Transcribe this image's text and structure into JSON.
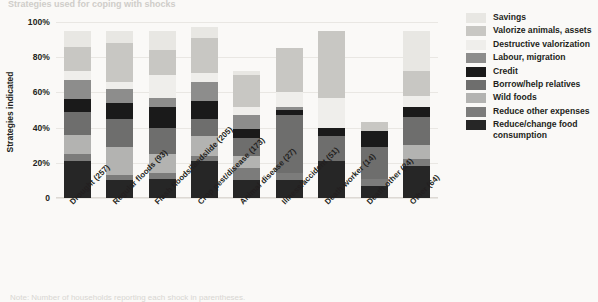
{
  "figure": {
    "title_sliver": "Strategies used for coping with shocks",
    "caption_sliver": "Note: Number of households reporting each shock in parentheses."
  },
  "axes": {
    "ylabel": "Strategies indicated",
    "yticks": [
      "0",
      "20%",
      "40%",
      "60%",
      "80%",
      "100%"
    ]
  },
  "legend": {
    "items": [
      {
        "label": "Savings",
        "color": "#e8e7e3"
      },
      {
        "label": "Valorize animals, assets",
        "color": "#c8c7c3"
      },
      {
        "label": "Destructive valorization",
        "color": "#efeeeb"
      },
      {
        "label": "Labour, migration",
        "color": "#8d8d8c"
      },
      {
        "label": "Credit",
        "color": "#1a1a1a"
      },
      {
        "label": "Borrow/help relatives",
        "color": "#6e6e6d"
      },
      {
        "label": "Wild foods",
        "color": "#b3b3b1"
      },
      {
        "label": "Reduce other expenses",
        "color": "#7c7c7b"
      },
      {
        "label": "Reduce/change food consumption",
        "color": "#262626"
      }
    ]
  },
  "chart_data": {
    "type": "bar",
    "subtype": "stacked-bar",
    "title": "Strategies used for coping with shocks",
    "xlabel": "",
    "ylabel": "Strategies indicated",
    "ylim": [
      0,
      100
    ],
    "yticks": [
      0,
      20,
      40,
      60,
      80,
      100
    ],
    "ytick_labels": [
      "0",
      "20%",
      "40%",
      "60%",
      "80%",
      "100%"
    ],
    "grid": true,
    "legend_position": "right",
    "stack_order_bottom_to_top": [
      "Reduce/change food consumption",
      "Reduce other expenses",
      "Wild foods",
      "Borrow/help relatives",
      "Credit",
      "Labour, migration",
      "Destructive valorization",
      "Valorize animals, assets",
      "Savings"
    ],
    "categories": [
      "Drought (257)",
      "Regular floods (93)",
      "Flash floods/landslide (205)",
      "Crop pest/disease (173)",
      "Animal disease (27)",
      "Illness/accident (51)",
      "Death worker (14)",
      "Death other (24)",
      "Other (64)"
    ],
    "series": [
      {
        "name": "Reduce/change food consumption",
        "color": "#262626",
        "values": [
          21,
          10,
          11,
          21,
          10,
          10,
          21,
          7,
          18
        ]
      },
      {
        "name": "Reduce other expenses",
        "color": "#7c7c7b",
        "values": [
          4,
          3,
          3,
          3,
          7,
          4,
          0,
          4,
          4
        ]
      },
      {
        "name": "Wild foods",
        "color": "#b3b3b1",
        "values": [
          11,
          16,
          11,
          11,
          7,
          0,
          0,
          0,
          8
        ]
      },
      {
        "name": "Borrow/help relatives",
        "color": "#6e6e6d",
        "values": [
          13,
          16,
          15,
          10,
          10,
          33,
          14,
          18,
          16
        ]
      },
      {
        "name": "Credit",
        "color": "#1a1a1a",
        "values": [
          7,
          9,
          12,
          10,
          5,
          3,
          5,
          9,
          6
        ]
      },
      {
        "name": "Labour, migration",
        "color": "#8d8d8c",
        "values": [
          11,
          8,
          5,
          11,
          8,
          2,
          0,
          0,
          0
        ]
      },
      {
        "name": "Destructive valorization",
        "color": "#efeeeb",
        "values": [
          5,
          4,
          13,
          5,
          5,
          8,
          17,
          0,
          6
        ]
      },
      {
        "name": "Valorize animals, assets",
        "color": "#c8c7c3",
        "values": [
          14,
          22,
          14,
          20,
          18,
          25,
          38,
          5,
          14
        ]
      },
      {
        "name": "Savings",
        "color": "#e8e7e3",
        "values": [
          9,
          7,
          11,
          6,
          2,
          0,
          0,
          0,
          23
        ]
      }
    ],
    "totals": [
      95,
      95,
      95,
      97,
      72,
      85,
      95,
      43,
      95
    ]
  }
}
